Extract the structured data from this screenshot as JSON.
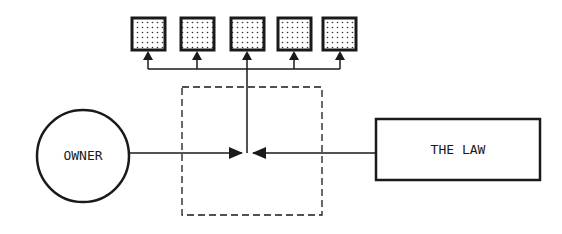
{
  "diagram": {
    "nodes": {
      "owner": {
        "label": "OWNER",
        "shape": "circle"
      },
      "law": {
        "label": "THE LAW",
        "shape": "rectangle"
      },
      "control_zone": {
        "shape": "dashed-rectangle"
      },
      "outputs": [
        {
          "shape": "dotted-square"
        },
        {
          "shape": "dotted-square"
        },
        {
          "shape": "dotted-square"
        },
        {
          "shape": "dotted-square"
        },
        {
          "shape": "dotted-square"
        }
      ]
    },
    "edges": [
      {
        "from": "owner",
        "to": "junction",
        "arrow": "into-junction"
      },
      {
        "from": "law",
        "to": "junction",
        "arrow": "into-junction"
      },
      {
        "from": "junction",
        "to": "outputs",
        "arrow": "up-to-each-square"
      }
    ],
    "colors": {
      "stroke": "#1a1a1a",
      "background": "#ffffff"
    }
  }
}
